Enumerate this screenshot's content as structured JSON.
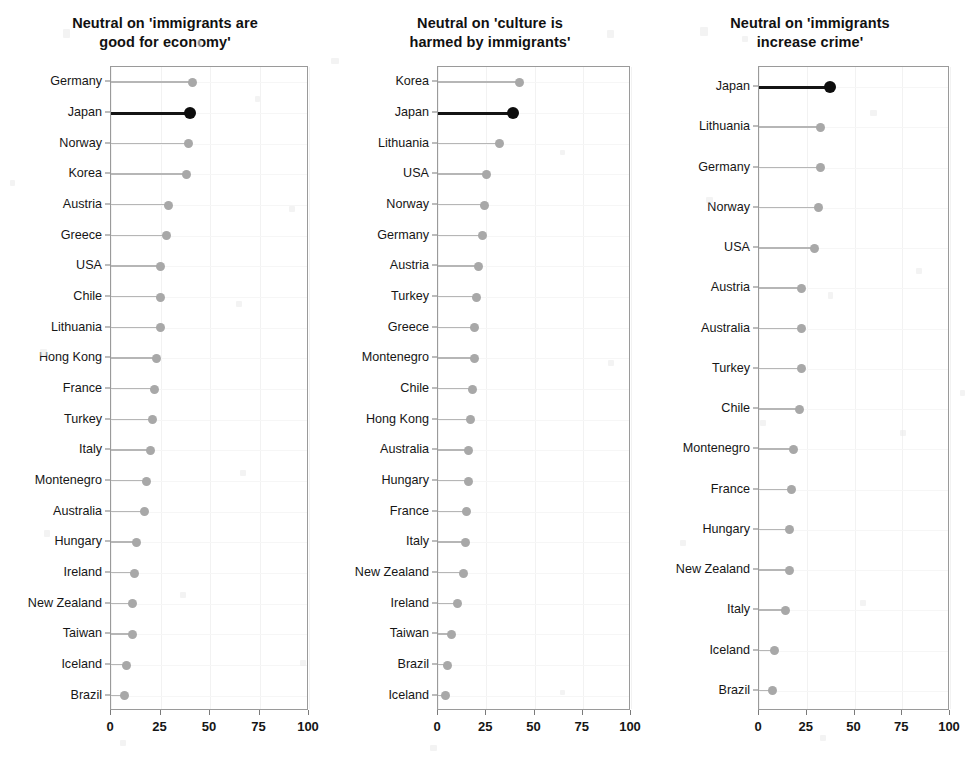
{
  "figure": {
    "background": "#ffffff",
    "dot_color": "#a8a8a8",
    "highlight_color": "#0d0d0d",
    "axis_color": "#9a9a9a",
    "highlight_country": "Japan"
  },
  "chart_data": [
    {
      "type": "bar",
      "subtype": "lollipop-dotplot",
      "title": "Neutral on 'immigrants are\ngood for economy'",
      "title_line1": "Neutral on 'immigrants are",
      "title_line2": "good for economy'",
      "xlabel": "",
      "ylabel": "",
      "xlim": [
        0,
        100
      ],
      "xticks": [
        0,
        25,
        50,
        75,
        100
      ],
      "xticklabels": [
        "0",
        "25",
        "50",
        "75",
        "100"
      ],
      "grid": true,
      "orientation": "horizontal",
      "highlight": "Japan",
      "categories": [
        "Germany",
        "Japan",
        "Norway",
        "Korea",
        "Austria",
        "Greece",
        "USA",
        "Chile",
        "Lithuania",
        "Hong Kong",
        "France",
        "Turkey",
        "Italy",
        "Montenegro",
        "Australia",
        "Hungary",
        "Ireland",
        "New Zealand",
        "Taiwan",
        "Iceland",
        "Brazil"
      ],
      "values": [
        41,
        40,
        39,
        38,
        29,
        28,
        25,
        25,
        25,
        23,
        22,
        21,
        20,
        18,
        17,
        13,
        12,
        11,
        11,
        8,
        7
      ]
    },
    {
      "type": "bar",
      "subtype": "lollipop-dotplot",
      "title": "Neutral on 'culture is\nharmed by immigrants'",
      "title_line1": "Neutral on 'culture is",
      "title_line2": "harmed by immigrants'",
      "xlabel": "",
      "ylabel": "",
      "xlim": [
        0,
        100
      ],
      "xticks": [
        0,
        25,
        50,
        75,
        100
      ],
      "xticklabels": [
        "0",
        "25",
        "50",
        "75",
        "100"
      ],
      "grid": true,
      "orientation": "horizontal",
      "highlight": "Japan",
      "categories": [
        "Korea",
        "Japan",
        "Lithuania",
        "USA",
        "Norway",
        "Germany",
        "Austria",
        "Turkey",
        "Greece",
        "Montenegro",
        "Chile",
        "Hong Kong",
        "Australia",
        "Hungary",
        "France",
        "Italy",
        "New Zealand",
        "Ireland",
        "Taiwan",
        "Brazil",
        "Iceland"
      ],
      "values": [
        42,
        39,
        32,
        25,
        24,
        23,
        21,
        20,
        19,
        19,
        18,
        17,
        16,
        16,
        15,
        14,
        13,
        10,
        7,
        5,
        4
      ]
    },
    {
      "type": "bar",
      "subtype": "lollipop-dotplot",
      "title": "Neutral on 'immigrants\nincrease crime'",
      "title_line1": "Neutral on 'immigrants",
      "title_line2": "increase crime'",
      "xlabel": "",
      "ylabel": "",
      "xlim": [
        0,
        100
      ],
      "xticks": [
        0,
        25,
        50,
        75,
        100
      ],
      "xticklabels": [
        "0",
        "25",
        "50",
        "75",
        "100"
      ],
      "grid": true,
      "orientation": "horizontal",
      "highlight": "Japan",
      "categories": [
        "Japan",
        "Lithuania",
        "Germany",
        "Norway",
        "USA",
        "Austria",
        "Australia",
        "Turkey",
        "Chile",
        "Montenegro",
        "France",
        "Hungary",
        "New Zealand",
        "Italy",
        "Iceland",
        "Brazil"
      ],
      "values": [
        37,
        32,
        32,
        31,
        29,
        22,
        22,
        22,
        21,
        18,
        17,
        16,
        16,
        14,
        8,
        7
      ]
    }
  ]
}
